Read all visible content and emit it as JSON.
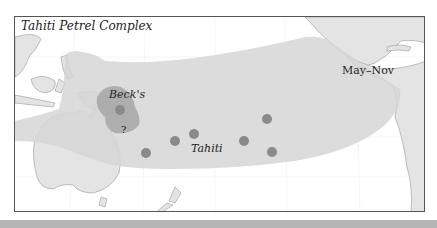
{
  "map": {
    "title": "Tahiti Petrel Complex",
    "labels": {
      "becks": "Beck's",
      "uncertain": "?",
      "tahiti": "Tahiti",
      "season": "May–Nov"
    },
    "colors": {
      "range_fill": "#d6d6d6",
      "becks_fill": "#a8a8a8",
      "breeding_dot": "#8a8a8a",
      "land": "#e4e4e4",
      "coast": "#999999",
      "frame": "#555555",
      "bottom_band": "#b4b4b4"
    },
    "breeding_sites": [
      {
        "name": "becks-site",
        "x": 105,
        "y": 93
      },
      {
        "name": "tahiti-site-1",
        "x": 131,
        "y": 136
      },
      {
        "name": "tahiti-site-2",
        "x": 160,
        "y": 124
      },
      {
        "name": "tahiti-site-3",
        "x": 179,
        "y": 117
      },
      {
        "name": "tahiti-site-4",
        "x": 229,
        "y": 124
      },
      {
        "name": "tahiti-site-5",
        "x": 252,
        "y": 102
      },
      {
        "name": "tahiti-site-6",
        "x": 257,
        "y": 135
      }
    ]
  }
}
